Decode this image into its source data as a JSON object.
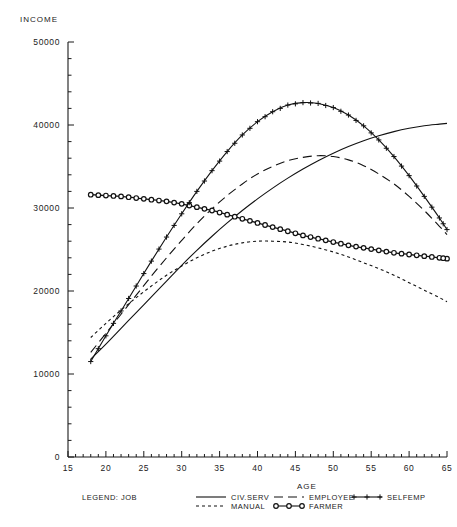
{
  "chart_data": {
    "type": "line",
    "title": "",
    "xlabel": "AGE",
    "ylabel": "INCOME",
    "xlim": [
      15,
      65
    ],
    "ylim": [
      0,
      50000
    ],
    "xticks": [
      "15",
      "20",
      "25",
      "30",
      "35",
      "40",
      "45",
      "50",
      "55",
      "60",
      "65"
    ],
    "yticks": [
      "0",
      "10000",
      "20000",
      "30000",
      "40000",
      "50000"
    ],
    "grid": false,
    "legend_position": "bottom",
    "legend_title": "LEGEND: JOB",
    "x": [
      18,
      20,
      22,
      24,
      26,
      28,
      30,
      32,
      34,
      36,
      38,
      40,
      42,
      44,
      46,
      48,
      50,
      52,
      54,
      56,
      58,
      60,
      62,
      64,
      65
    ],
    "series": [
      {
        "name": "CIV.SERV",
        "style": "solid",
        "marker": "none",
        "values": [
          11800,
          13600,
          15500,
          17400,
          19300,
          21200,
          23100,
          24900,
          26600,
          28200,
          29700,
          31100,
          32400,
          33600,
          34700,
          35700,
          36600,
          37400,
          38100,
          38700,
          39200,
          39600,
          39900,
          40100,
          40200
        ]
      },
      {
        "name": "MANUAL",
        "style": "short-dash",
        "marker": "none",
        "values": [
          14400,
          16100,
          17700,
          19200,
          20600,
          21900,
          23000,
          24000,
          24800,
          25400,
          25800,
          26000,
          26000,
          25900,
          25600,
          25200,
          24700,
          24100,
          23400,
          22700,
          21900,
          21000,
          20100,
          19200,
          18700
        ]
      },
      {
        "name": "EMPLOYEE",
        "style": "long-dash",
        "marker": "none",
        "values": [
          12600,
          14900,
          17200,
          19500,
          21800,
          24000,
          26100,
          28100,
          29900,
          31500,
          32900,
          34100,
          35000,
          35700,
          36100,
          36300,
          36200,
          35800,
          35100,
          34100,
          32900,
          31400,
          29700,
          27800,
          26800
        ]
      },
      {
        "name": "FARMER",
        "style": "solid",
        "marker": "circle",
        "values": [
          31600,
          31500,
          31400,
          31200,
          31000,
          30800,
          30500,
          30100,
          29700,
          29200,
          28700,
          28200,
          27700,
          27200,
          26700,
          26300,
          25900,
          25500,
          25200,
          24900,
          24600,
          24400,
          24200,
          24000,
          23900
        ]
      },
      {
        "name": "SELFEMP",
        "style": "solid",
        "marker": "plus",
        "values": [
          11500,
          14600,
          17600,
          20600,
          23600,
          26500,
          29300,
          32000,
          34500,
          36800,
          38800,
          40400,
          41600,
          42400,
          42700,
          42600,
          42100,
          41200,
          39900,
          38200,
          36200,
          33900,
          31400,
          28800,
          27400
        ]
      }
    ]
  },
  "legend": {
    "title": "LEGEND: JOB",
    "entries": [
      {
        "label": "CIV.SERV",
        "style": "solid",
        "marker": "none"
      },
      {
        "label": "MANUAL",
        "style": "short-dash",
        "marker": "none"
      },
      {
        "label": "EMPLOYEE",
        "style": "long-dash",
        "marker": "none"
      },
      {
        "label": "FARMER",
        "style": "solid",
        "marker": "circle"
      },
      {
        "label": "SELFEMP",
        "style": "solid",
        "marker": "plus"
      }
    ]
  },
  "colors": {
    "ink": "#1a1a1a",
    "background": "#ffffff"
  }
}
